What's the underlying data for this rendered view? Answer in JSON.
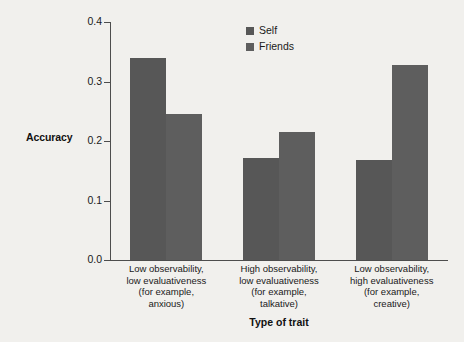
{
  "chart_data": {
    "type": "bar",
    "title": "",
    "subtitle": "",
    "xlabel": "Type of trait",
    "ylabel": "Accuracy",
    "ylim": [
      0.0,
      0.4
    ],
    "yticks": [
      "0.0",
      "0.1",
      "0.2",
      "0.3",
      "0.4"
    ],
    "ytick_values": [
      0.0,
      0.1,
      0.2,
      0.3,
      0.4
    ],
    "grid": false,
    "legend_position": "top-center-right",
    "categories": [
      "Low observability, low evaluativeness (for example, anxious)",
      "High observability, low evaluativeness (for example, talkative)",
      "Low observability, high evaluativeness (for example, creative)"
    ],
    "category_lines": [
      [
        "Low observability,",
        "low evaluativeness",
        "(for example,",
        "anxious)"
      ],
      [
        "High observability,",
        "low evaluativeness",
        "(for example,",
        "talkative)"
      ],
      [
        "Low observability,",
        "high evaluativeness",
        "(for example,",
        "creative)"
      ]
    ],
    "series": [
      {
        "name": "Self",
        "color": "#575757",
        "values": [
          0.34,
          0.172,
          0.168
        ]
      },
      {
        "name": "Friends",
        "color": "#5e5e5e",
        "values": [
          0.245,
          0.215,
          0.327
        ]
      }
    ]
  },
  "colors": {
    "background": "#f1f0ed",
    "axis": "#4d4d4d",
    "text": "#1a1a1a",
    "bar_self": "#575757",
    "bar_friends": "#5e5e5e"
  }
}
